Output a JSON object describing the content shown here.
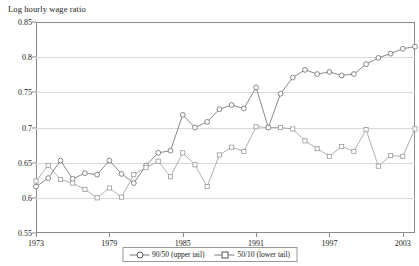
{
  "chart_data": {
    "type": "line",
    "title": "",
    "ylabel": "Log hourly wage ratio",
    "xlabel": "",
    "ylim": [
      0.55,
      0.85
    ],
    "xlim": [
      1973,
      2004
    ],
    "yticks": [
      0.55,
      0.6,
      0.65,
      0.7,
      0.75,
      0.8,
      0.85
    ],
    "ytick_labels": [
      "0.55",
      "0.6",
      "0.65",
      "0.7",
      "0.75",
      "0.8",
      "0.85"
    ],
    "xticks": [
      1973,
      1979,
      1985,
      1991,
      1997,
      2003
    ],
    "xtick_labels": [
      "1973",
      "1979",
      "1985",
      "1991",
      "1997",
      "2003"
    ],
    "grid": true,
    "legend_position": "bottom-center",
    "x": [
      1973,
      1974,
      1975,
      1976,
      1977,
      1978,
      1979,
      1980,
      1981,
      1982,
      1983,
      1984,
      1985,
      1986,
      1987,
      1988,
      1989,
      1990,
      1991,
      1992,
      1993,
      1994,
      1995,
      1996,
      1997,
      1998,
      1999,
      2000,
      2001,
      2002,
      2003,
      2004
    ],
    "series": [
      {
        "name": "90/50 (upper tail)",
        "marker": "circle",
        "color": "#6b6b6b",
        "values": [
          0.616,
          0.628,
          0.653,
          0.627,
          0.635,
          0.633,
          0.653,
          0.634,
          0.621,
          0.646,
          0.664,
          0.667,
          0.718,
          0.7,
          0.708,
          0.726,
          0.732,
          0.727,
          0.757,
          0.7,
          0.748,
          0.771,
          0.782,
          0.776,
          0.779,
          0.774,
          0.776,
          0.79,
          0.799,
          0.805,
          0.812,
          0.815
        ]
      },
      {
        "name": "50/10 (lower tail)",
        "marker": "square",
        "color": "#9a9a9a",
        "values": [
          0.624,
          0.646,
          0.626,
          0.621,
          0.612,
          0.6,
          0.614,
          0.601,
          0.633,
          0.643,
          0.652,
          0.63,
          0.664,
          0.647,
          0.616,
          0.661,
          0.672,
          0.666,
          0.701,
          0.7,
          0.7,
          0.698,
          0.681,
          0.67,
          0.659,
          0.673,
          0.666,
          0.697,
          0.645,
          0.66,
          0.659,
          0.698
        ]
      }
    ]
  },
  "legend": {
    "items": [
      {
        "label": "90/50 (upper tail)",
        "marker": "circle"
      },
      {
        "label": "50/10 (lower tail)",
        "marker": "square"
      }
    ]
  }
}
